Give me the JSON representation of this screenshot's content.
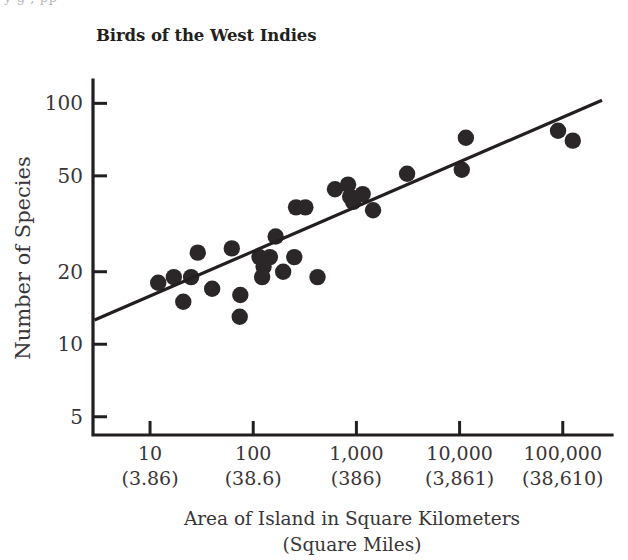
{
  "page": {
    "top_bleed_text": "y                        g                                     ,                        pp"
  },
  "chart_data": {
    "type": "scatter",
    "title": "Birds of the West Indies",
    "xlabel": "Area of Island in Square Kilometers",
    "xlabel_sub": "(Square Miles)",
    "ylabel": "Number of Species",
    "x_scale": "log",
    "y_scale": "log",
    "xlim": [
      2.8,
      300000
    ],
    "ylim": [
      4.2,
      125
    ],
    "grid": false,
    "legend": null,
    "x_ticks": [
      {
        "value": 10,
        "label": "10",
        "sublabel": "(3.86)"
      },
      {
        "value": 100,
        "label": "100",
        "sublabel": "(38.6)"
      },
      {
        "value": 1000,
        "label": "1,000",
        "sublabel": "(386)"
      },
      {
        "value": 10000,
        "label": "10,000",
        "sublabel": "(3,861)"
      },
      {
        "value": 100000,
        "label": "100,000",
        "sublabel": "(38,610)"
      }
    ],
    "y_ticks": [
      {
        "value": 100,
        "label": "100"
      },
      {
        "value": 50,
        "label": "50"
      },
      {
        "value": 20,
        "label": "20"
      },
      {
        "value": 10,
        "label": "10"
      },
      {
        "value": 5,
        "label": "5"
      }
    ],
    "points": [
      {
        "x": 12,
        "y": 18
      },
      {
        "x": 17,
        "y": 19
      },
      {
        "x": 21,
        "y": 15
      },
      {
        "x": 25,
        "y": 19
      },
      {
        "x": 29,
        "y": 24
      },
      {
        "x": 40,
        "y": 17
      },
      {
        "x": 62,
        "y": 25
      },
      {
        "x": 75,
        "y": 16
      },
      {
        "x": 74,
        "y": 13
      },
      {
        "x": 115,
        "y": 23
      },
      {
        "x": 126,
        "y": 21
      },
      {
        "x": 122,
        "y": 19
      },
      {
        "x": 165,
        "y": 28
      },
      {
        "x": 145,
        "y": 23
      },
      {
        "x": 195,
        "y": 20
      },
      {
        "x": 250,
        "y": 23
      },
      {
        "x": 260,
        "y": 37
      },
      {
        "x": 320,
        "y": 37
      },
      {
        "x": 420,
        "y": 19
      },
      {
        "x": 620,
        "y": 44
      },
      {
        "x": 830,
        "y": 46
      },
      {
        "x": 870,
        "y": 41
      },
      {
        "x": 1150,
        "y": 42
      },
      {
        "x": 930,
        "y": 39
      },
      {
        "x": 1450,
        "y": 36
      },
      {
        "x": 3100,
        "y": 51
      },
      {
        "x": 10500,
        "y": 53
      },
      {
        "x": 11500,
        "y": 72
      },
      {
        "x": 90000,
        "y": 77
      },
      {
        "x": 125000,
        "y": 70
      }
    ],
    "fit_line": {
      "label": "regression-line",
      "x_start": 2.9,
      "y_start": 12.6,
      "x_end": 240000,
      "y_end": 103
    }
  }
}
